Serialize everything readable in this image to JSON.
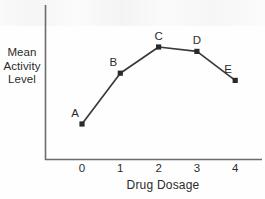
{
  "chart_data": {
    "type": "line",
    "title": "",
    "xlabel": "Drug Dosage",
    "ylabel": "Mean Activity Level",
    "ylabel_lines": [
      "Mean",
      "Activity",
      "Level"
    ],
    "x": [
      0,
      1,
      2,
      3,
      4
    ],
    "xtick_labels": [
      "0",
      "1",
      "2",
      "3",
      "4"
    ],
    "ytick_labels": [],
    "xlim": [
      -0.4,
      4.7
    ],
    "ylim": [
      0,
      100
    ],
    "grid": false,
    "legend": null,
    "series": [
      {
        "name": "Mean Activity Level",
        "values": [
          22,
          57,
          75,
          72,
          52
        ],
        "point_labels": [
          "A",
          "B",
          "C",
          "D",
          "E"
        ],
        "line_color": "#3a3a3a",
        "marker_color": "#2a2a2a",
        "marker": "square"
      }
    ],
    "annotations": [
      {
        "label": "A",
        "x": 0,
        "y": 22,
        "position": "above-left"
      },
      {
        "label": "B",
        "x": 1,
        "y": 57,
        "position": "above-left"
      },
      {
        "label": "C",
        "x": 2,
        "y": 75,
        "position": "above"
      },
      {
        "label": "D",
        "x": 3,
        "y": 72,
        "position": "above"
      },
      {
        "label": "E",
        "x": 4,
        "y": 52,
        "position": "above-left"
      }
    ],
    "axes": {
      "x_axis_visible": true,
      "y_axis_visible": true,
      "axis_color": "#6b6b6b",
      "top_spine": false,
      "right_spine": false
    },
    "colors": {
      "background": "#fefefe",
      "foreground": "#2b2b2b",
      "line": "#3a3a3a",
      "axis": "#6b6b6b"
    }
  }
}
